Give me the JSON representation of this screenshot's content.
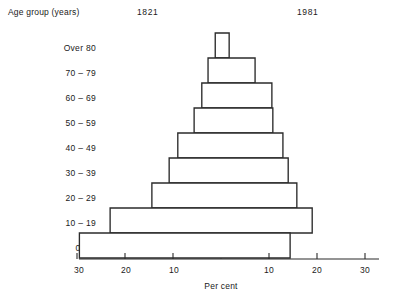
{
  "figure": {
    "age_axis_title": "Age group (years)",
    "x_axis_title": "Per cent",
    "left_series_label": "1821",
    "right_series_label": "1981",
    "stroke_color": "#2b2b2b",
    "fill_color": "#ffffff",
    "background_color": "#ffffff"
  },
  "axis": {
    "tick_labels_left": [
      "30",
      "20",
      "10"
    ],
    "tick_labels_right": [
      "10",
      "20",
      "30"
    ],
    "tick_values_left": [
      30,
      20,
      10
    ],
    "tick_values_right": [
      10,
      20,
      30
    ],
    "max": 30,
    "min": 0
  },
  "age_labels": {
    "g0": "Over 80",
    "g1": "70 – 79",
    "g2": "60 – 69",
    "g3": "50 – 59",
    "g4": "40 – 49",
    "g5": "30 – 39",
    "g6": "20 – 29",
    "g7": "10 – 19",
    "g8": "0 – 9"
  },
  "chart_data": {
    "type": "bar",
    "title": "",
    "subtitle": "",
    "xlabel": "Per cent",
    "ylabel": "Age group (years)",
    "orientation": "horizontal",
    "layout": "population-pyramid",
    "grid": false,
    "legend": "inline-top",
    "xlim": [
      -30,
      30
    ],
    "xticks_left": [
      30,
      20,
      10
    ],
    "xticks_right": [
      10,
      20,
      30
    ],
    "categories": [
      "Over 80",
      "70 – 79",
      "60 – 69",
      "50 – 59",
      "40 – 49",
      "30 – 39",
      "20 – 29",
      "10 – 19",
      "0 – 9"
    ],
    "series": [
      {
        "name": "1821",
        "side": "left",
        "values": [
          1.2,
          2.7,
          4.0,
          5.6,
          9.0,
          10.8,
          14.4,
          23.1,
          29.5
        ]
      },
      {
        "name": "1981",
        "side": "right",
        "values": [
          1.7,
          7.1,
          10.6,
          10.8,
          12.9,
          14.0,
          15.8,
          19.0,
          14.4
        ]
      }
    ]
  },
  "bars": [
    {
      "group": "Over 80",
      "left": 1.2,
      "right": 1.7,
      "row": 0
    },
    {
      "group": "70 – 79",
      "left": 2.7,
      "right": 7.1,
      "row": 1
    },
    {
      "group": "60 – 69",
      "left": 4.0,
      "right": 10.6,
      "row": 2
    },
    {
      "group": "50 – 59",
      "left": 5.6,
      "right": 10.8,
      "row": 3
    },
    {
      "group": "40 – 49",
      "left": 9.0,
      "right": 12.9,
      "row": 4
    },
    {
      "group": "30 – 39",
      "left": 10.8,
      "right": 14.0,
      "row": 5
    },
    {
      "group": "20 – 29",
      "left": 14.4,
      "right": 15.8,
      "row": 6
    },
    {
      "group": "10 – 19",
      "left": 23.1,
      "right": 19.0,
      "row": 7
    },
    {
      "group": "0 – 9",
      "left": 29.5,
      "right": 14.4,
      "row": 8
    }
  ]
}
